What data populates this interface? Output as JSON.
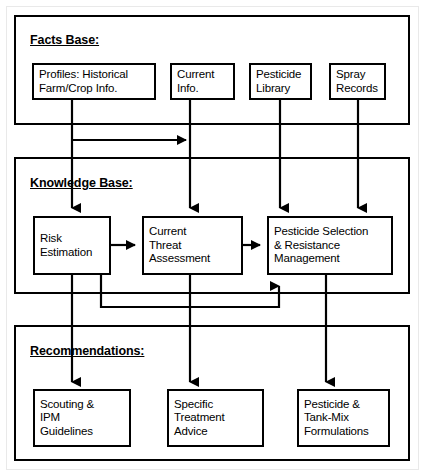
{
  "diagram": {
    "type": "flowchart",
    "stroke_color": "#000000",
    "background_color": "#ffffff",
    "panels": [
      {
        "id": "facts-base",
        "title": "Facts Base:",
        "nodes": [
          {
            "id": "profiles",
            "lines": [
              "Profiles: Historical",
              "Farm/Crop Info."
            ]
          },
          {
            "id": "current-info",
            "lines": [
              "Current",
              "Info."
            ]
          },
          {
            "id": "pesticide-library",
            "lines": [
              "Pesticide",
              "Library"
            ]
          },
          {
            "id": "spray-records",
            "lines": [
              "Spray",
              "Records"
            ]
          }
        ]
      },
      {
        "id": "knowledge-base",
        "title": "Knowledge Base:",
        "nodes": [
          {
            "id": "risk-estimation",
            "lines": [
              "Risk",
              "Estimation"
            ]
          },
          {
            "id": "current-threat-assessment",
            "lines": [
              "Current",
              "Threat",
              "Assessment"
            ]
          },
          {
            "id": "pesticide-selection",
            "lines": [
              "Pesticide Selection",
              "& Resistance",
              "Management"
            ]
          }
        ]
      },
      {
        "id": "recommendations",
        "title": "Recommendations:",
        "nodes": [
          {
            "id": "scouting-ipm",
            "lines": [
              "Scouting &",
              "IPM",
              "Guidelines"
            ]
          },
          {
            "id": "specific-treatment-advice",
            "lines": [
              "Specific",
              "Treatment",
              "Advice"
            ]
          },
          {
            "id": "pesticide-tank-mix",
            "lines": [
              "Pesticide &",
              "Tank-Mix",
              "Formulations"
            ]
          }
        ]
      }
    ],
    "connections": [
      {
        "from": "profiles",
        "to": "current-info",
        "kind": "branch-right"
      },
      {
        "from": "profiles",
        "to": "risk-estimation",
        "kind": "down-arrow"
      },
      {
        "from": "current-info",
        "to": "current-threat-assessment",
        "kind": "down-arrow"
      },
      {
        "from": "pesticide-library",
        "to": "pesticide-selection",
        "kind": "down-arrow"
      },
      {
        "from": "spray-records",
        "to": "pesticide-selection",
        "kind": "down-arrow"
      },
      {
        "from": "risk-estimation",
        "to": "current-threat-assessment",
        "kind": "right-arrow"
      },
      {
        "from": "current-threat-assessment",
        "to": "pesticide-selection",
        "kind": "right-arrow"
      },
      {
        "from": "risk-estimation",
        "to": "pesticide-selection",
        "kind": "feedback-up-arrow"
      },
      {
        "from": "risk-estimation",
        "to": "scouting-ipm",
        "kind": "down-arrow"
      },
      {
        "from": "current-threat-assessment",
        "to": "specific-treatment-advice",
        "kind": "down-arrow"
      },
      {
        "from": "pesticide-selection",
        "to": "pesticide-tank-mix",
        "kind": "down-arrow"
      }
    ]
  }
}
